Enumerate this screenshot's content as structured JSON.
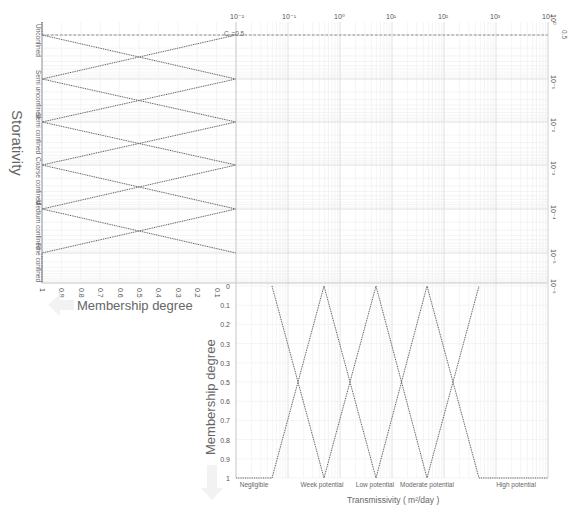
{
  "chart_data": [
    {
      "type": "line",
      "title": "Storativity membership functions",
      "ylabel": "Storativity",
      "xlabel": "Membership degree",
      "x_ticks": [
        "1",
        "0.9",
        "0.8",
        "0.7",
        "0.6",
        "0.5",
        "0.4",
        "0.3",
        "0.2",
        "0.1"
      ],
      "xlim": [
        1,
        0
      ],
      "y_scale": "log",
      "y_ticks": [
        "10^0",
        "10^-1",
        "10^-2",
        "10^-3",
        "10^-4",
        "10^-5",
        "10^-6"
      ],
      "categories": [
        "Unconfined",
        "Semi unconfined",
        "Semi confined",
        "Coarse confined",
        "Medium confined",
        "Fine confined"
      ],
      "annotation": "C0=0.5",
      "grid": true
    },
    {
      "type": "line",
      "title": "Transmissivity membership functions",
      "xlabel": "Transmissivity ( m²/day )",
      "ylabel": "Membership degree",
      "x_scale": "log",
      "x_ticks": [
        "10^-2",
        "10^-1",
        "10^0",
        "10^1",
        "10^2",
        "10^3",
        "10^4"
      ],
      "y_ticks": [
        "0",
        "0.1",
        "0.2",
        "0.3",
        "0.3",
        "0.5",
        "0.6",
        "0.7",
        "0.8",
        "0.9",
        "1"
      ],
      "ylim": [
        0,
        1
      ],
      "categories": [
        "Negligible",
        "Week potential",
        "Low potential",
        "Moderate potential",
        "High potential"
      ],
      "series": [
        {
          "name": "Negligible",
          "x": [
            0.01,
            1.0,
            3.16
          ],
          "membership": [
            1,
            1,
            0
          ]
        },
        {
          "name": "Week potential",
          "x": [
            1.0,
            3.16,
            10
          ],
          "membership": [
            0,
            1,
            0
          ]
        },
        {
          "name": "Low potential",
          "x": [
            3.16,
            10,
            31.6
          ],
          "membership": [
            0,
            1,
            0
          ]
        },
        {
          "name": "Moderate potential",
          "x": [
            10,
            31.6,
            100
          ],
          "membership": [
            0,
            1,
            0
          ]
        },
        {
          "name": "High potential",
          "x": [
            31.6,
            100,
            10000
          ],
          "membership": [
            0,
            1,
            1
          ]
        }
      ],
      "grid": true
    }
  ],
  "labels": {
    "storativity": "Storativity",
    "membership_left": "Membership degree",
    "membership_bottom": "Membership degree",
    "transmissivity": "Transmissivity ( m²/day )",
    "c0": "C₀=0.5",
    "half": "0.5"
  },
  "top_ticks": [
    "10⁻²",
    "10⁻¹",
    "10⁰",
    "10¹",
    "10²",
    "10³",
    "10⁴"
  ],
  "right_ticks": [
    "10⁰",
    "10⁻¹",
    "10⁻²",
    "10⁻³",
    "10⁻⁴",
    "10⁻⁵",
    "10⁻⁶"
  ],
  "left_x_ticks": [
    "1",
    "0.9",
    "0.8",
    "0.7",
    "0.6",
    "0.5",
    "0.4",
    "0.3",
    "0.2",
    "0.1"
  ],
  "bottom_y_ticks": [
    "0",
    "0.1",
    "0.2",
    "0.3",
    "0.3",
    "0.5",
    "0.6",
    "0.7",
    "0.8",
    "0.9",
    "1"
  ],
  "storativity_classes": [
    "Unconfined",
    "Semi unconfined",
    "Semi confined",
    "Coarse confined",
    "Medium confined",
    "Fine confined"
  ],
  "transmissivity_classes": [
    "Negligible",
    "Week potential",
    "Low potential",
    "Moderate potential",
    "High potential"
  ]
}
